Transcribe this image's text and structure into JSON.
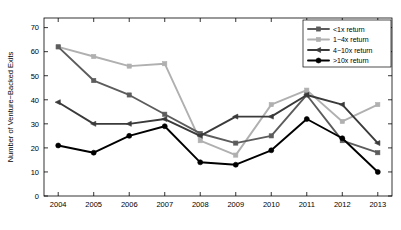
{
  "chart_data": {
    "type": "line",
    "title": "",
    "xlabel": "",
    "ylabel": "Number of Venture−Backed Exits",
    "categories": [
      "2004",
      "2005",
      "2006",
      "2007",
      "2008",
      "2009",
      "2010",
      "2011",
      "2012",
      "2013"
    ],
    "x": [
      2004,
      2005,
      2006,
      2007,
      2008,
      2009,
      2010,
      2011,
      2012,
      2013
    ],
    "xlim": [
      2003.6,
      2013.4
    ],
    "ylim": [
      0,
      74
    ],
    "yticks": [
      0,
      10,
      20,
      30,
      40,
      50,
      60,
      70
    ],
    "ytick_labels": [
      "0",
      "10",
      "20",
      "30",
      "40",
      "50",
      "60",
      "70"
    ],
    "xtick_labels": [
      "2004",
      "2005",
      "2006",
      "2007",
      "2008",
      "2009",
      "2010",
      "2011",
      "2012",
      "2013"
    ],
    "grid": false,
    "legend_position": "top-right",
    "series": [
      {
        "name": "<1x return",
        "marker": "square",
        "color": "#5c5c5c",
        "values": [
          62,
          48,
          42,
          34,
          26,
          22,
          25,
          42,
          23,
          18
        ]
      },
      {
        "name": "1−4x return",
        "marker": "square",
        "color": "#b0b0b0",
        "values": [
          62,
          58,
          54,
          55,
          23,
          17,
          38,
          44,
          31,
          38
        ]
      },
      {
        "name": "4−10x return",
        "marker": "triangle-left",
        "color": "#3a3a3a",
        "values": [
          39,
          30,
          30,
          32,
          25,
          33,
          33,
          42,
          38,
          22
        ]
      },
      {
        "name": ">10x return",
        "marker": "circle",
        "color": "#000000",
        "values": [
          21,
          18,
          25,
          29,
          14,
          13,
          19,
          32,
          24,
          10
        ]
      }
    ]
  },
  "legend": {
    "entries": [
      {
        "label": "<1x return"
      },
      {
        "label": "1−4x return"
      },
      {
        "label": "4−10x return"
      },
      {
        "label": ">10x return"
      }
    ]
  }
}
